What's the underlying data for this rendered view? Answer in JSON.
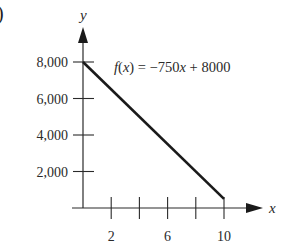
{
  "corner_label": ")",
  "chart_data": {
    "type": "line",
    "title": "",
    "function_label": "f(x) = −750x + 8000",
    "xlabel": "x",
    "ylabel": "y",
    "xlim": [
      0,
      10
    ],
    "ylim": [
      0,
      8000
    ],
    "x_ticks": [
      0,
      2,
      4,
      6,
      8,
      10
    ],
    "x_tick_labels": [
      "2",
      "6",
      "10"
    ],
    "x_tick_label_values": [
      2,
      6,
      10
    ],
    "y_ticks": [
      2000,
      4000,
      6000,
      8000
    ],
    "y_tick_labels": [
      "2,000",
      "4,000",
      "6,000",
      "8,000"
    ],
    "grid": false,
    "legend": null,
    "series": [
      {
        "name": "f(x) = −750x + 8000",
        "x": [
          0,
          10
        ],
        "y": [
          8000,
          500
        ],
        "color": "#1a1a1a"
      }
    ]
  },
  "labels": {
    "y_axis": "y",
    "x_axis": "x",
    "func_prefix": "f",
    "func_arg": "(x)",
    "func_eq": " = −750",
    "func_var": "x",
    "func_rest": " + 8000"
  }
}
